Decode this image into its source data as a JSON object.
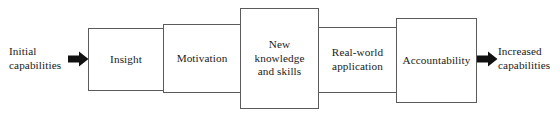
{
  "diagram": {
    "type": "linear-process-flow",
    "orientation": "left-to-right",
    "background_color": "#ffffff",
    "box_border_color": "#5b5b5b",
    "arrow_color": "#111111",
    "text_color": "#1a1a1a",
    "input": {
      "label": "Initial\ncapabilities",
      "arrow": "right-block-arrow"
    },
    "output": {
      "label": "Increased\ncapabilities",
      "arrow": "right-block-arrow"
    },
    "stages": [
      {
        "id": "insight",
        "label": "Insight"
      },
      {
        "id": "motivation",
        "label": "Motivation"
      },
      {
        "id": "knowledge",
        "label": "New\nknowledge\nand skills"
      },
      {
        "id": "application",
        "label": "Real-world\napplication"
      },
      {
        "id": "accountability",
        "label": "Accountability"
      }
    ]
  }
}
